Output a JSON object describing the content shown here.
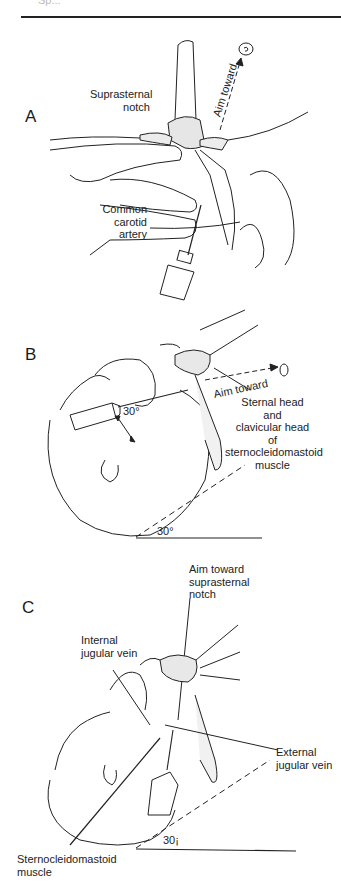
{
  "header": {
    "cutoff_text": "Sp...",
    "rule": "horizontal-divider"
  },
  "panels": [
    {
      "letter": "A",
      "labels": {
        "suprasternal_notch": [
          "Suprasternal",
          "notch"
        ],
        "aim_toward": "Aim toward",
        "common_carotid_artery": [
          "Common carotid",
          "artery"
        ]
      },
      "icons": [
        "target-icon",
        "syringe-icon",
        "dashed-arrow-icon"
      ]
    },
    {
      "letter": "B",
      "labels": {
        "angle_syringe": "30°",
        "aim_toward": "Aim toward",
        "sternal_head": [
          "Sternal head",
          "and",
          "clavicular head",
          "of",
          "sternocleidomastoid",
          "muscle"
        ],
        "angle_base": "30°"
      },
      "icons": [
        "target-icon",
        "syringe-icon",
        "dashed-arrow-icon",
        "double-arrow-icon"
      ]
    },
    {
      "letter": "C",
      "labels": {
        "aim_toward_notch": [
          "Aim toward",
          "suprasternal",
          "notch"
        ],
        "internal_jugular_vein": [
          "Internal",
          "jugular vein"
        ],
        "external_jugular_vein": [
          "External",
          "jugular vein"
        ],
        "sternocleidomastoid_muscle": [
          "Sternocleidomastoid",
          "muscle"
        ],
        "angle_base": "30¡"
      },
      "icons": [
        "syringe-icon"
      ]
    }
  ]
}
